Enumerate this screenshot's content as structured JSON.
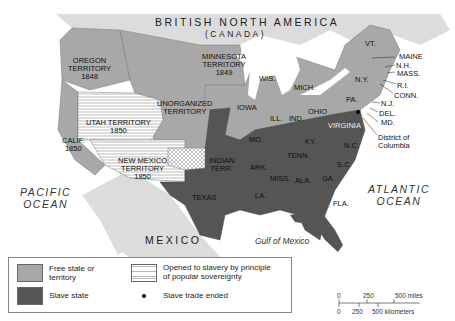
{
  "map": {
    "regions": {
      "canada": "BRITISH NORTH AMERICA",
      "canada_sub": "(CANADA)",
      "mexico": "MEXICO",
      "pacific": [
        "PACIFIC",
        "OCEAN"
      ],
      "atlantic": [
        "ATLANTIC",
        "OCEAN"
      ],
      "gulf": "Gulf of Mexico"
    },
    "territories": {
      "oregon": [
        "OREGON",
        "TERRITORY",
        "1848"
      ],
      "minnesota": [
        "MINNESOTA",
        "TERRITORY",
        "1849"
      ],
      "unorganized": [
        "UNORGANIZED",
        "TERRITORY"
      ],
      "utah": [
        "UTAH TERRITORY",
        "1850"
      ],
      "california": [
        "CALIF.",
        "1850"
      ],
      "new_mexico": [
        "NEW MEXICO",
        "TERRITORY",
        "1850"
      ],
      "indian": [
        "INDIAN",
        "TERR."
      ]
    },
    "states": {
      "wis": "WIS.",
      "mich": "MICH.",
      "iowa": "IOWA",
      "ill": "ILL.",
      "ind": "IND.",
      "ohio": "OHIO",
      "pa": "PA.",
      "ny": "N.Y.",
      "vt": "VT.",
      "maine": "MAINE",
      "nh": "N.H.",
      "mass": "MASS.",
      "ri": "R.I.",
      "conn": "CONN.",
      "nj": "N.J.",
      "del": "DEL.",
      "md": "MD.",
      "dc": [
        "District of",
        "Columbia"
      ],
      "virginia": "VIRGINIA",
      "mo": "MO.",
      "ky": "KY.",
      "tenn": "TENN.",
      "nc": "N.C.",
      "sc": "S.C.",
      "ark": "ARK.",
      "miss": "MISS.",
      "ala": "ALA.",
      "ga": "GA.",
      "la": "LA.",
      "fla": "FLA.",
      "texas": "TEXAS"
    }
  },
  "legend": {
    "free": [
      "Free state or",
      "territory"
    ],
    "slave": "Slave state",
    "popular": [
      "Opened to slavery by principle",
      "of popular sovereignty"
    ],
    "trade": "Slave trade ended"
  },
  "scale": {
    "miles": [
      "0",
      "250",
      "500 miles"
    ],
    "km": [
      "0",
      "250",
      "500 kilometers"
    ]
  },
  "colors": {
    "free": "#a8a8a8",
    "slave": "#555555",
    "foreign": "#dcdcdc",
    "water": "#ffffff"
  }
}
